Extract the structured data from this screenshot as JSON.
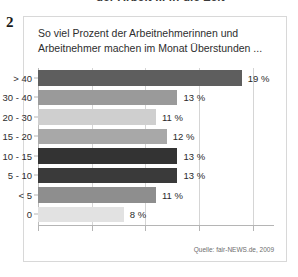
{
  "figure": {
    "number": "2",
    "clipped_headline": "der Arbeit ... in die Zeit",
    "title": "So viel Prozent der Arbeitnehmerinnen und\nArbeitnehmer machen im Monat Überstunden ...",
    "source": "Quelle: fair-NEWS.de, 2009"
  },
  "colors": {
    "panel_border": "#d8d8d8",
    "gridline": "#d5d5d5",
    "axis": "#b5b5b5",
    "text": "#2e2e2e"
  },
  "chart_data": {
    "type": "bar",
    "orientation": "horizontal",
    "title": "So viel Prozent der Arbeitnehmerinnen und Arbeitnehmer machen im Monat Überstunden ...",
    "xlabel": "",
    "ylabel": "",
    "xlim": [
      0,
      22
    ],
    "grid": true,
    "legend": null,
    "categories": [
      "> 40",
      "30 - 40",
      "20 - 30",
      "15 - 20",
      "10 - 15",
      "5 - 10",
      "< 5",
      "0"
    ],
    "values": [
      19,
      13,
      11,
      12,
      13,
      13,
      11,
      8
    ],
    "value_labels": [
      "19 %",
      "13 %",
      "11 %",
      "12 %",
      "13 %",
      "13 %",
      "11 %",
      "8 %"
    ],
    "bar_colors": [
      "#5e5e5e",
      "#9a9a9a",
      "#cfcfcf",
      "#a8a8a8",
      "#333333",
      "#3a3a3a",
      "#8e8e8e",
      "#e2e2e2"
    ],
    "xticks": [
      0,
      5,
      10,
      15,
      20
    ],
    "gridlines": [
      0,
      5,
      10,
      15,
      20
    ]
  }
}
